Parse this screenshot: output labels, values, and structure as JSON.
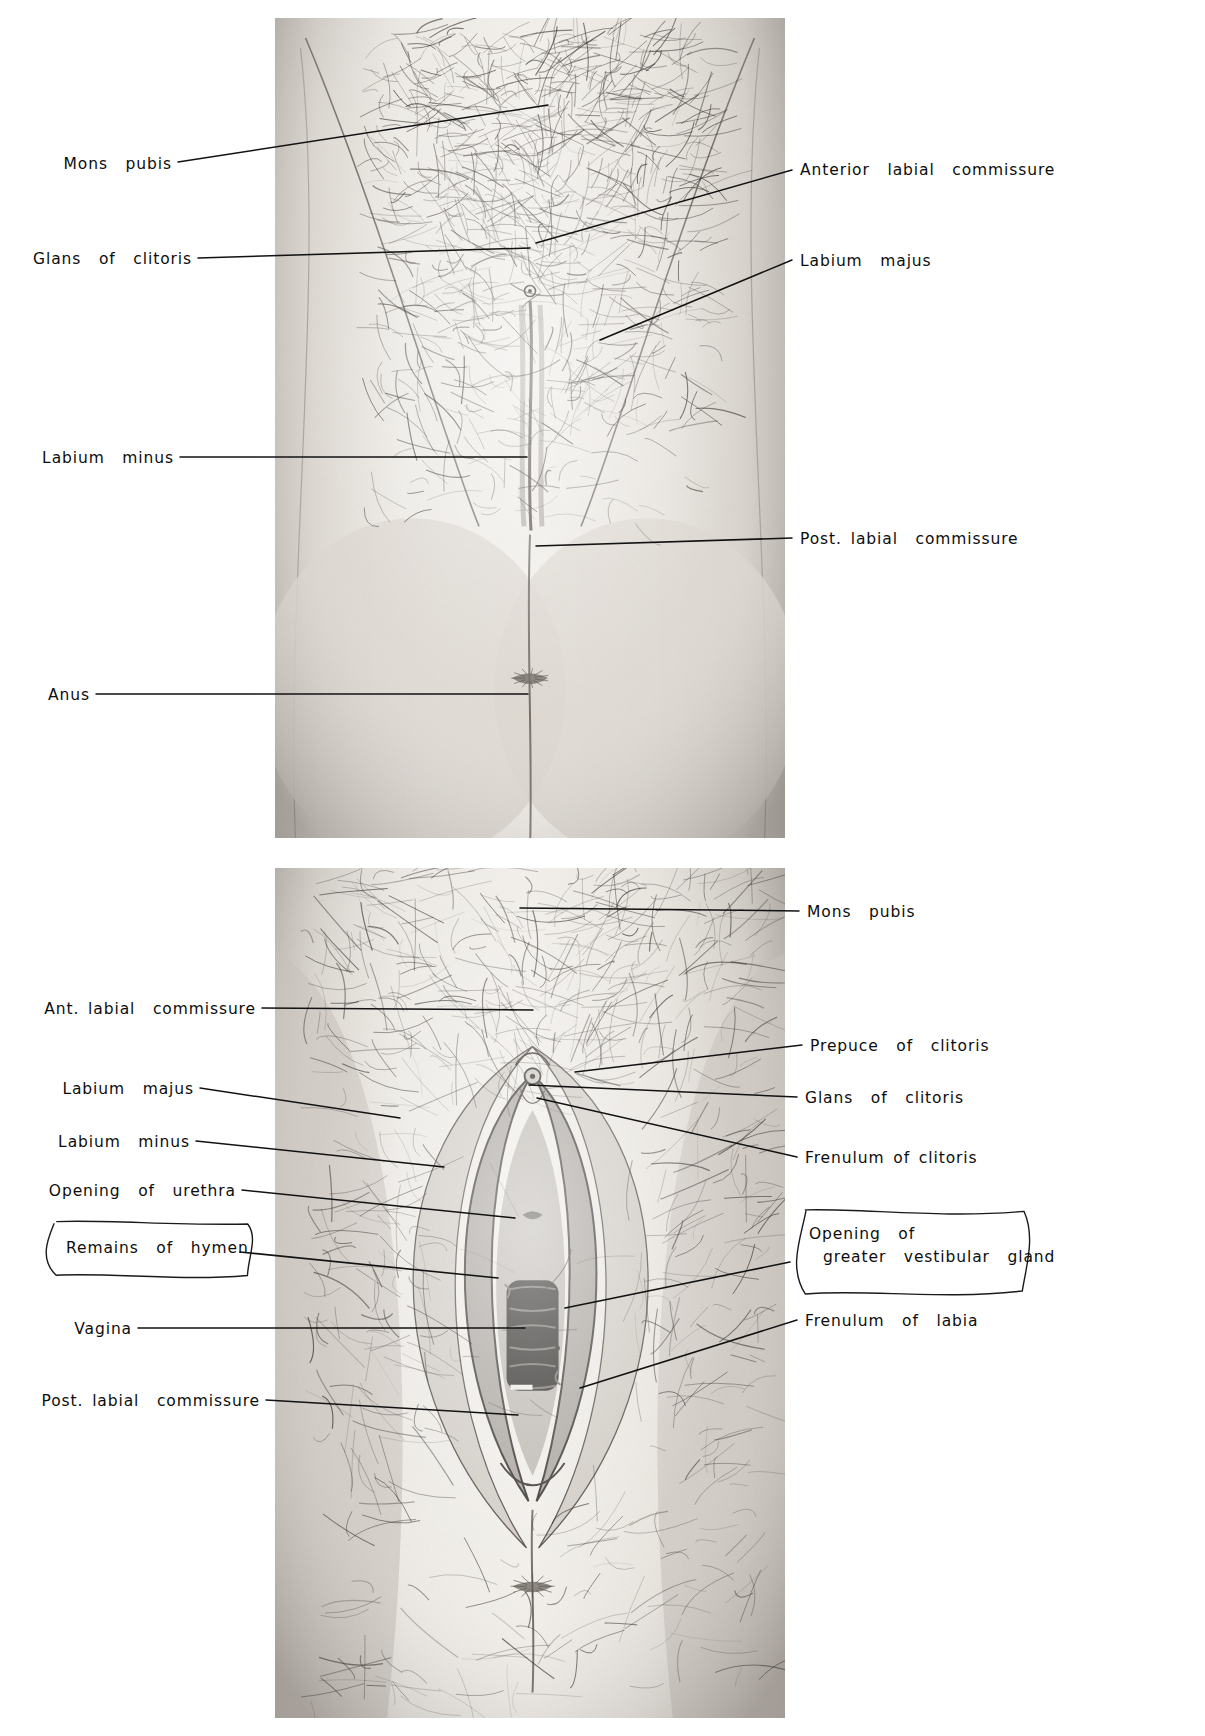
{
  "plate": {
    "title": "Female external genitalia — labelled anatomical plate",
    "background_color": "#ffffff",
    "ink_color": "#0d0d0d"
  },
  "figures": [
    {
      "id": "upper-figure",
      "name": "perineum-closed-labia",
      "caption": "",
      "bounds": {
        "x": 275,
        "y": 18,
        "w": 510,
        "h": 820
      }
    },
    {
      "id": "lower-figure",
      "name": "vulva-labia-separated",
      "caption": "",
      "bounds": {
        "x": 275,
        "y": 868,
        "w": 510,
        "h": 850
      }
    }
  ],
  "upper_labels": [
    {
      "text": "Mons  pubis",
      "side": "left",
      "x": 60,
      "y": 155,
      "lx": 178,
      "ly": 162,
      "tx": 548,
      "ty": 105
    },
    {
      "text": "Glans  of  clitoris",
      "side": "left",
      "x": 52,
      "y": 250,
      "lx": 198,
      "ly": 258,
      "tx": 530,
      "ty": 248
    },
    {
      "text": "Labium  minus",
      "side": "left",
      "x": 57,
      "y": 449,
      "lx": 180,
      "ly": 457,
      "tx": 527,
      "ty": 457
    },
    {
      "text": "Anus",
      "side": "left",
      "x": 50,
      "y": 686,
      "lx": 96,
      "ly": 694,
      "tx": 528,
      "ty": 694
    },
    {
      "text": "Anterior  labial  commissure",
      "side": "right",
      "x": 800,
      "y": 161,
      "lx": 792,
      "ly": 170,
      "tx": 536,
      "ty": 243
    },
    {
      "text": "Labium  majus",
      "side": "right",
      "x": 800,
      "y": 252,
      "lx": 792,
      "ly": 260,
      "tx": 600,
      "ty": 340
    },
    {
      "text": "Post. labial  commissure",
      "side": "right",
      "x": 800,
      "y": 530,
      "lx": 792,
      "ly": 538,
      "tx": 536,
      "ty": 546
    }
  ],
  "lower_labels": [
    {
      "text": "Mons  pubis",
      "side": "right",
      "x": 807,
      "y": 903,
      "lx": 799,
      "ly": 911,
      "tx": 520,
      "ty": 908
    },
    {
      "text": "Ant. labial  commissure",
      "side": "left",
      "x": 52,
      "y": 1000,
      "lx": 262,
      "ly": 1008,
      "tx": 533,
      "ty": 1010
    },
    {
      "text": "Prepuce  of  clitoris",
      "side": "right",
      "x": 810,
      "y": 1037,
      "lx": 802,
      "ly": 1045,
      "tx": 575,
      "ty": 1072
    },
    {
      "text": "Labium  majus",
      "side": "left",
      "x": 60,
      "y": 1080,
      "lx": 200,
      "ly": 1088,
      "tx": 400,
      "ty": 1118
    },
    {
      "text": "Glans  of  clitoris",
      "side": "right",
      "x": 805,
      "y": 1089,
      "lx": 797,
      "ly": 1097,
      "tx": 529,
      "ty": 1085
    },
    {
      "text": "Labium  minus",
      "side": "left",
      "x": 62,
      "y": 1133,
      "lx": 196,
      "ly": 1141,
      "tx": 444,
      "ty": 1167
    },
    {
      "text": "Frenulum of clitoris",
      "side": "right",
      "x": 805,
      "y": 1149,
      "lx": 797,
      "ly": 1157,
      "tx": 537,
      "ty": 1098
    },
    {
      "text": "Opening  of  urethra",
      "side": "left",
      "x": 57,
      "y": 1182,
      "lx": 242,
      "ly": 1190,
      "tx": 515,
      "ty": 1218
    },
    {
      "text": "Vagina",
      "side": "left",
      "x": 62,
      "y": 1320,
      "lx": 138,
      "ly": 1328,
      "tx": 525,
      "ty": 1328
    },
    {
      "text": "Frenulum  of  labia",
      "side": "right",
      "x": 805,
      "y": 1312,
      "lx": 797,
      "ly": 1320,
      "tx": 580,
      "ty": 1388
    },
    {
      "text": "Post. labial  commissure",
      "side": "left",
      "x": 70,
      "y": 1392,
      "lx": 266,
      "ly": 1400,
      "tx": 518,
      "ty": 1415
    }
  ],
  "callouts": [
    {
      "id": "remains-of-hymen",
      "name": "remains-of-hymen-callout",
      "text": "Remains  of  hymen",
      "box": {
        "x": 46,
        "y": 1222,
        "w": 208,
        "h": 54
      },
      "text_pos": {
        "x": 20,
        "y": 16
      },
      "leader": {
        "x1": 240,
        "y1": 1252,
        "x2": 498,
        "y2": 1278
      }
    },
    {
      "id": "opening-of-greater-vestibular-gland",
      "name": "greater-vestibular-gland-callout",
      "text_lines": [
        "Opening  of",
        "greater  vestibular  gland"
      ],
      "box": {
        "x": 795,
        "y": 1212,
        "w": 235,
        "h": 80
      },
      "text_pos": {
        "x": 14,
        "y": 12
      },
      "leader": {
        "x1": 790,
        "y1": 1262,
        "x2": 565,
        "y2": 1308
      }
    }
  ],
  "chart_data": {
    "type": "table",
    "categories": [
      "Mons pubis",
      "Glans of clitoris",
      "Prepuce of clitoris",
      "Frenulum of clitoris",
      "Labium majus",
      "Labium minus",
      "Anterior labial commissure",
      "Posterior labial commissure",
      "Opening of urethra",
      "Remains of hymen",
      "Vagina",
      "Opening of greater vestibular gland",
      "Frenulum of labia",
      "Anus"
    ],
    "values": [
      2,
      2,
      1,
      1,
      2,
      2,
      2,
      2,
      1,
      1,
      1,
      1,
      1,
      1
    ],
    "xlabel": "structure",
    "ylabel": "times labelled across the two figures"
  }
}
